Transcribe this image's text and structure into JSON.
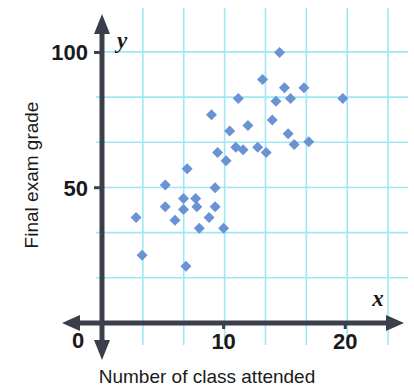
{
  "chart_data": {
    "type": "scatter",
    "title": "",
    "xlabel": "Number of class attended",
    "ylabel": "Final exam grade",
    "x_axis_var": "x",
    "y_axis_var": "y",
    "xlim": [
      0,
      24.5
    ],
    "ylim": [
      0,
      112
    ],
    "x_ticks": [
      {
        "value": 10,
        "label": "10"
      },
      {
        "value": 20,
        "label": "20"
      }
    ],
    "y_ticks": [
      {
        "value": 50,
        "label": "50"
      },
      {
        "value": 100,
        "label": "100"
      }
    ],
    "origin_label": "0",
    "grid": true,
    "grid_color": "#9fe7f5",
    "grid_x_spacing": 3.36,
    "grid_y_spacing": 16.7,
    "axis_color": "#3a3f4a",
    "marker_color": "#6a93d4",
    "marker_shape": "diamond",
    "marker_size": 11,
    "legend": null,
    "points": [
      {
        "x": 2.8,
        "y": 39
      },
      {
        "x": 3.3,
        "y": 25
      },
      {
        "x": 5.2,
        "y": 51
      },
      {
        "x": 5.2,
        "y": 43
      },
      {
        "x": 6.0,
        "y": 38
      },
      {
        "x": 6.9,
        "y": 21
      },
      {
        "x": 6.7,
        "y": 46
      },
      {
        "x": 6.7,
        "y": 42
      },
      {
        "x": 7.0,
        "y": 57
      },
      {
        "x": 7.7,
        "y": 46
      },
      {
        "x": 7.8,
        "y": 43
      },
      {
        "x": 8.0,
        "y": 35
      },
      {
        "x": 8.8,
        "y": 39
      },
      {
        "x": 9.0,
        "y": 77
      },
      {
        "x": 9.3,
        "y": 43
      },
      {
        "x": 9.3,
        "y": 50
      },
      {
        "x": 9.5,
        "y": 63
      },
      {
        "x": 10.0,
        "y": 35
      },
      {
        "x": 10.2,
        "y": 60
      },
      {
        "x": 10.5,
        "y": 71
      },
      {
        "x": 11.0,
        "y": 65
      },
      {
        "x": 11.2,
        "y": 83
      },
      {
        "x": 11.6,
        "y": 64
      },
      {
        "x": 12.0,
        "y": 73
      },
      {
        "x": 12.8,
        "y": 65
      },
      {
        "x": 13.2,
        "y": 90
      },
      {
        "x": 13.5,
        "y": 63
      },
      {
        "x": 14.0,
        "y": 75
      },
      {
        "x": 14.3,
        "y": 82
      },
      {
        "x": 14.6,
        "y": 100
      },
      {
        "x": 15.0,
        "y": 87
      },
      {
        "x": 15.3,
        "y": 70
      },
      {
        "x": 15.5,
        "y": 83
      },
      {
        "x": 15.8,
        "y": 66
      },
      {
        "x": 16.6,
        "y": 87
      },
      {
        "x": 17.0,
        "y": 67
      },
      {
        "x": 19.8,
        "y": 83
      }
    ]
  },
  "figure": {
    "background": "#ffffff",
    "plot_area": {
      "left": 102,
      "right": 400,
      "top": 20,
      "bottom": 323
    }
  }
}
